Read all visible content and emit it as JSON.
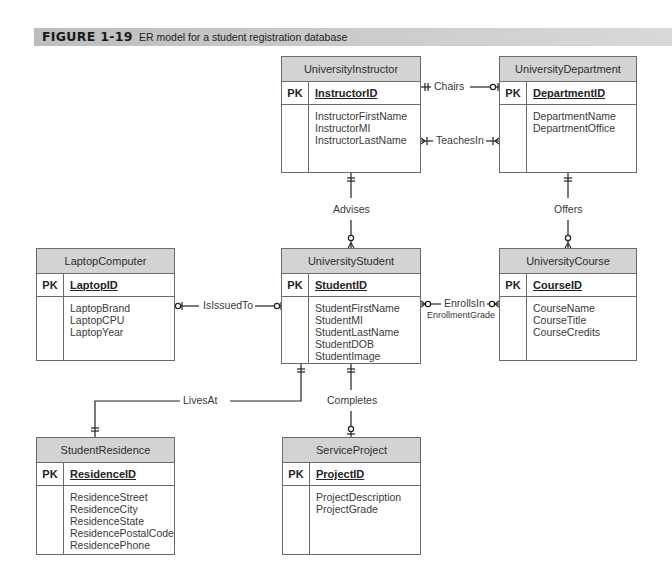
{
  "figure": {
    "number": "FIGURE 1-19",
    "caption": "ER model for a student registration database"
  },
  "entities": {
    "instructor": {
      "name": "UniversityInstructor",
      "pk_label": "PK",
      "pk": "InstructorID",
      "attributes": [
        "InstructorFirstName",
        "InstructorMI",
        "InstructorLastName"
      ]
    },
    "department": {
      "name": "UniversityDepartment",
      "pk_label": "PK",
      "pk": "DepartmentID",
      "attributes": [
        "DepartmentName",
        "DepartmentOffice"
      ]
    },
    "laptop": {
      "name": "LaptopComputer",
      "pk_label": "PK",
      "pk": "LaptopID",
      "attributes": [
        "LaptopBrand",
        "LaptopCPU",
        "LaptopYear"
      ]
    },
    "student": {
      "name": "UniversityStudent",
      "pk_label": "PK",
      "pk": "StudentID",
      "attributes": [
        "StudentFirstName",
        "StudentMI",
        "StudentLastName",
        "StudentDOB",
        "StudentImage"
      ]
    },
    "course": {
      "name": "UniversityCourse",
      "pk_label": "PK",
      "pk": "CourseID",
      "attributes": [
        "CourseName",
        "CourseTitle",
        "CourseCredits"
      ]
    },
    "residence": {
      "name": "StudentResidence",
      "pk_label": "PK",
      "pk": "ResidenceID",
      "attributes": [
        "ResidenceStreet",
        "ResidenceCity",
        "ResidenceState",
        "ResidencePostalCode",
        "ResidencePhone"
      ]
    },
    "project": {
      "name": "ServiceProject",
      "pk_label": "PK",
      "pk": "ProjectID",
      "attributes": [
        "ProjectDescription",
        "ProjectGrade"
      ]
    }
  },
  "relationships": {
    "chairs": {
      "label": "Chairs",
      "from": "UniversityInstructor",
      "to": "UniversityDepartment",
      "from_card": "one-and-only-one",
      "to_card": "zero-or-one"
    },
    "teaches_in": {
      "label": "TeachesIn",
      "from": "UniversityInstructor",
      "to": "UniversityDepartment",
      "from_card": "one-or-many",
      "to_card": "one-or-many"
    },
    "advises": {
      "label": "Advises",
      "from": "UniversityInstructor",
      "to": "UniversityStudent",
      "from_card": "one-and-only-one",
      "to_card": "zero-or-many"
    },
    "offers": {
      "label": "Offers",
      "from": "UniversityDepartment",
      "to": "UniversityCourse",
      "from_card": "one-and-only-one",
      "to_card": "zero-or-many"
    },
    "is_issued_to": {
      "label": "IsIssuedTo",
      "from": "LaptopComputer",
      "to": "UniversityStudent",
      "from_card": "zero-or-one",
      "to_card": "zero-or-one"
    },
    "enrolls_in": {
      "label": "EnrollsIn",
      "attribute": "EnrollmentGrade",
      "from": "UniversityStudent",
      "to": "UniversityCourse",
      "from_card": "zero-or-many",
      "to_card": "zero-or-many"
    },
    "lives_at": {
      "label": "LivesAt",
      "from": "UniversityStudent",
      "to": "StudentResidence",
      "from_card": "one-and-only-one",
      "to_card": "one-and-only-one"
    },
    "completes": {
      "label": "Completes",
      "from": "UniversityStudent",
      "to": "ServiceProject",
      "from_card": "one-and-only-one",
      "to_card": "zero-or-one"
    }
  }
}
